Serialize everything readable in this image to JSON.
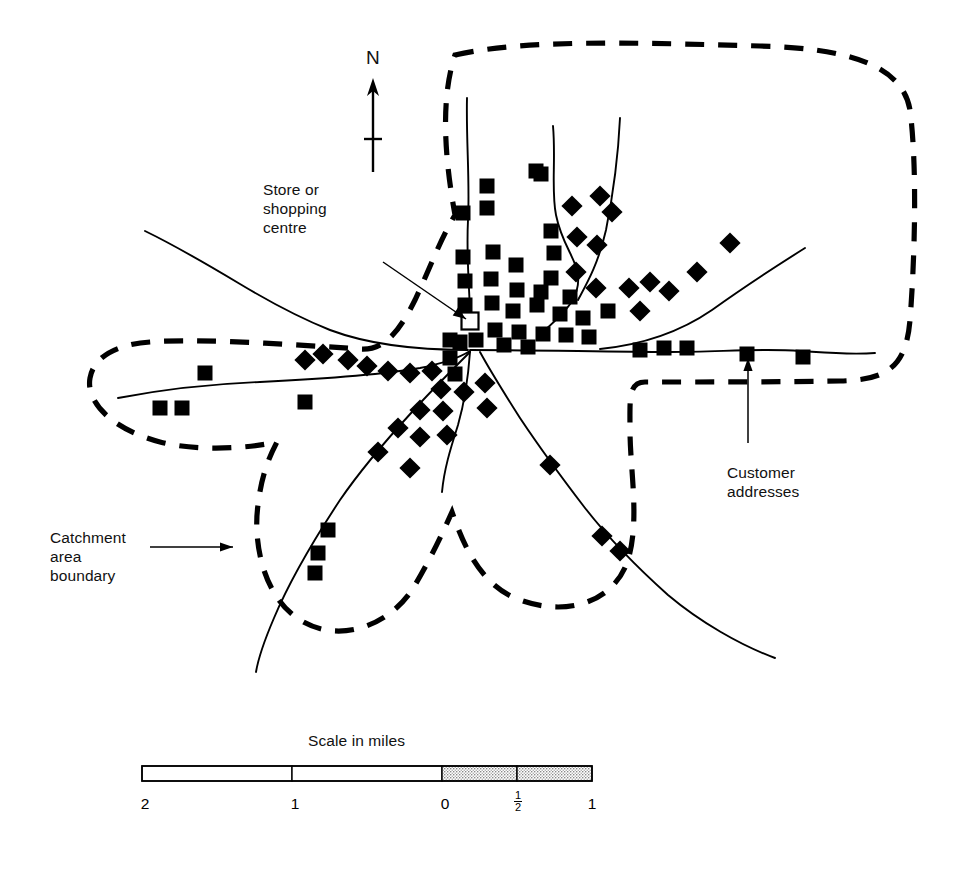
{
  "figure": {
    "kind": "catchment-area-map",
    "background_color": "#ffffff",
    "ink_color": "#000000"
  },
  "labels": {
    "store": "Store or\nshopping\ncentre",
    "customer": "Customer\naddresses",
    "catchment": "Catchment\narea\nboundary",
    "north": "N"
  },
  "scale": {
    "title": "Scale in miles",
    "ticks": [
      "2",
      "1",
      "0",
      "1",
      "1"
    ],
    "half_numerator": "1",
    "half_denominator": "2",
    "bar_left_px": 142,
    "bar_right_px": 592,
    "segments": [
      {
        "from": 142,
        "to": 292,
        "fill": "white"
      },
      {
        "from": 292,
        "to": 442,
        "fill": "white"
      },
      {
        "from": 442,
        "to": 517,
        "fill": "stipple"
      },
      {
        "from": 517,
        "to": 592,
        "fill": "stipple"
      }
    ]
  },
  "legend": {
    "store_symbol": "hollow-square",
    "customer_symbol": "filled-square",
    "boundary_symbol": "thick-dashed-line",
    "road_symbol": "thin-solid-line"
  },
  "map_data": {
    "store": {
      "x": 470,
      "y": 321,
      "size": 17
    },
    "leader_lines": [
      {
        "name": "store-leader",
        "from": [
          383,
          262
        ],
        "to": [
          466,
          319
        ]
      },
      {
        "name": "customer-leader",
        "from": [
          748,
          443
        ],
        "to": [
          748,
          358
        ]
      },
      {
        "name": "catchment-leader",
        "from": [
          150,
          547
        ],
        "to": [
          233,
          547
        ]
      }
    ],
    "north_arrow": {
      "x": 373,
      "shaft_top": 82,
      "shaft_bottom": 172,
      "cross_y": 139
    },
    "boundary_path": "M 455 55 C 520 40 620 42 760 46 C 840 48 902 62 910 110 C 918 172 914 270 910 320 C 906 368 886 380 840 381 C 790 382 700 382 645 382 C 628 382 630 400 630 430 C 630 470 640 520 628 560 C 615 600 570 618 520 600 C 478 585 462 540 452 512 C 444 530 430 560 415 585 C 392 625 340 645 300 620 C 262 596 253 540 258 505 C 262 470 272 452 277 442 C 250 448 200 452 160 442 C 108 428 86 400 90 378 C 94 355 120 344 150 342 C 200 338 300 345 360 349 C 385 351 400 330 415 300 C 430 268 440 240 455 215 C 445 160 440 100 455 55 Z",
    "roads": [
      {
        "name": "road-north-main",
        "path": "M 467 98 C 466 140 470 180 468 220 C 466 260 470 290 470 320"
      },
      {
        "name": "road-north-fork-east",
        "path": "M 553 126 C 556 160 551 190 556 215 C 562 245 576 258 578 275 C 580 295 570 308 545 330"
      },
      {
        "name": "road-north-east-branch",
        "path": "M 620 118 C 618 160 612 200 606 230 C 598 265 586 285 578 300"
      },
      {
        "name": "road-northeast-diag",
        "path": "M 805 248 C 770 270 740 290 712 310 C 680 332 640 345 600 349"
      },
      {
        "name": "road-east-horizontal",
        "path": "M 470 350 C 540 350 610 352 670 352 C 720 352 760 348 800 351 C 830 353 850 355 875 353"
      },
      {
        "name": "road-west-upper",
        "path": "M 145 231 C 180 248 210 266 240 284 C 270 302 300 318 330 330 C 370 345 420 350 468 350"
      },
      {
        "name": "road-west-lower",
        "path": "M 118 398 C 160 390 210 384 260 382 C 320 379 380 375 420 368 C 450 362 462 356 470 351"
      },
      {
        "name": "road-southwest-diag",
        "path": "M 470 352 C 450 372 430 392 412 412 C 390 436 362 468 340 500 C 315 538 290 580 274 618 C 262 646 258 660 256 672"
      },
      {
        "name": "road-south-centre",
        "path": "M 470 352 C 468 380 464 404 458 425 C 450 450 444 470 442 492"
      },
      {
        "name": "road-southeast-diag",
        "path": "M 480 352 C 492 374 506 396 520 418 C 540 448 562 478 585 508 C 610 540 640 570 668 595 C 700 622 740 645 775 658"
      }
    ],
    "customer_markers": [
      {
        "x": 463,
        "y": 213,
        "r": 0
      },
      {
        "x": 487,
        "y": 186,
        "r": 0
      },
      {
        "x": 487,
        "y": 208,
        "r": 0
      },
      {
        "x": 536,
        "y": 171,
        "r": 0
      },
      {
        "x": 463,
        "y": 257,
        "r": 0
      },
      {
        "x": 493,
        "y": 252,
        "r": 0
      },
      {
        "x": 516,
        "y": 265,
        "r": 0
      },
      {
        "x": 541,
        "y": 174,
        "r": 0
      },
      {
        "x": 572,
        "y": 206,
        "r": 45
      },
      {
        "x": 600,
        "y": 196,
        "r": 45
      },
      {
        "x": 612,
        "y": 212,
        "r": 45
      },
      {
        "x": 551,
        "y": 231,
        "r": 0
      },
      {
        "x": 577,
        "y": 237,
        "r": 45
      },
      {
        "x": 597,
        "y": 245,
        "r": 45
      },
      {
        "x": 554,
        "y": 253,
        "r": 0
      },
      {
        "x": 551,
        "y": 278,
        "r": 0
      },
      {
        "x": 576,
        "y": 272,
        "r": 45
      },
      {
        "x": 465,
        "y": 281,
        "r": 0
      },
      {
        "x": 491,
        "y": 279,
        "r": 0
      },
      {
        "x": 517,
        "y": 290,
        "r": 0
      },
      {
        "x": 541,
        "y": 292,
        "r": 0
      },
      {
        "x": 570,
        "y": 297,
        "r": 0
      },
      {
        "x": 596,
        "y": 288,
        "r": 45
      },
      {
        "x": 465,
        "y": 305,
        "r": 0
      },
      {
        "x": 492,
        "y": 303,
        "r": 0
      },
      {
        "x": 513,
        "y": 311,
        "r": 0
      },
      {
        "x": 537,
        "y": 305,
        "r": 0
      },
      {
        "x": 560,
        "y": 314,
        "r": 0
      },
      {
        "x": 583,
        "y": 318,
        "r": 0
      },
      {
        "x": 608,
        "y": 311,
        "r": 0
      },
      {
        "x": 629,
        "y": 288,
        "r": 45
      },
      {
        "x": 650,
        "y": 282,
        "r": 45
      },
      {
        "x": 669,
        "y": 291,
        "r": 45
      },
      {
        "x": 640,
        "y": 311,
        "r": 45
      },
      {
        "x": 495,
        "y": 330,
        "r": 0
      },
      {
        "x": 519,
        "y": 332,
        "r": 0
      },
      {
        "x": 543,
        "y": 334,
        "r": 0
      },
      {
        "x": 566,
        "y": 335,
        "r": 0
      },
      {
        "x": 589,
        "y": 337,
        "r": 0
      },
      {
        "x": 697,
        "y": 272,
        "r": 45
      },
      {
        "x": 730,
        "y": 243,
        "r": 45
      },
      {
        "x": 664,
        "y": 348,
        "r": 0
      },
      {
        "x": 687,
        "y": 348,
        "r": 0
      },
      {
        "x": 747,
        "y": 354,
        "r": 0
      },
      {
        "x": 803,
        "y": 357,
        "r": 0
      },
      {
        "x": 640,
        "y": 350,
        "r": 0
      },
      {
        "x": 450,
        "y": 340,
        "r": 0
      },
      {
        "x": 450,
        "y": 358,
        "r": 0
      },
      {
        "x": 455,
        "y": 374,
        "r": 0
      },
      {
        "x": 432,
        "y": 371,
        "r": 45
      },
      {
        "x": 410,
        "y": 373,
        "r": 45
      },
      {
        "x": 388,
        "y": 371,
        "r": 45
      },
      {
        "x": 367,
        "y": 366,
        "r": 45
      },
      {
        "x": 348,
        "y": 360,
        "r": 45
      },
      {
        "x": 323,
        "y": 354,
        "r": 45
      },
      {
        "x": 305,
        "y": 360,
        "r": 45
      },
      {
        "x": 160,
        "y": 408,
        "r": 0
      },
      {
        "x": 182,
        "y": 408,
        "r": 0
      },
      {
        "x": 205,
        "y": 373,
        "r": 0
      },
      {
        "x": 305,
        "y": 402,
        "r": 0
      },
      {
        "x": 504,
        "y": 345,
        "r": 0
      },
      {
        "x": 528,
        "y": 347,
        "r": 0
      },
      {
        "x": 464,
        "y": 392,
        "r": 45
      },
      {
        "x": 441,
        "y": 389,
        "r": 45
      },
      {
        "x": 443,
        "y": 411,
        "r": 45
      },
      {
        "x": 420,
        "y": 410,
        "r": 45
      },
      {
        "x": 485,
        "y": 383,
        "r": 45
      },
      {
        "x": 487,
        "y": 408,
        "r": 45
      },
      {
        "x": 398,
        "y": 428,
        "r": 45
      },
      {
        "x": 420,
        "y": 437,
        "r": 45
      },
      {
        "x": 447,
        "y": 435,
        "r": 45
      },
      {
        "x": 378,
        "y": 452,
        "r": 45
      },
      {
        "x": 410,
        "y": 468,
        "r": 45
      },
      {
        "x": 550,
        "y": 465,
        "r": 45
      },
      {
        "x": 328,
        "y": 530,
        "r": 0
      },
      {
        "x": 318,
        "y": 553,
        "r": 0
      },
      {
        "x": 315,
        "y": 573,
        "r": 0
      },
      {
        "x": 602,
        "y": 536,
        "r": 45
      },
      {
        "x": 620,
        "y": 551,
        "r": 45
      },
      {
        "x": 460,
        "y": 342,
        "r": 0
      },
      {
        "x": 476,
        "y": 340,
        "r": 0
      }
    ]
  }
}
